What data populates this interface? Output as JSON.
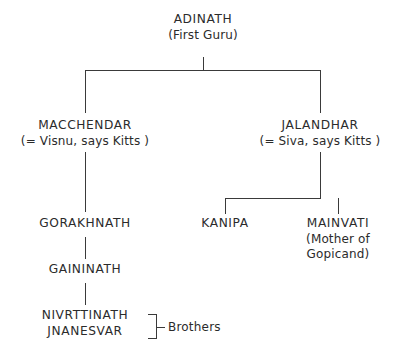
{
  "diagram": {
    "title_text": "ADINATH",
    "type": "genealogy-tree",
    "line_color": "#3a3a3a",
    "text_color": "#2b2b2b",
    "background_color": "#ffffff",
    "nodes": {
      "adinath": {
        "name": "ADINATH",
        "subtitle": "(First Guru)"
      },
      "macchendar": {
        "name": "MACCHENDAR",
        "subtitle": "(= Visnu, says Kitts )"
      },
      "jalandhar": {
        "name": "JALANDHAR",
        "subtitle": "(= Siva, says Kitts )"
      },
      "gorakhnath": {
        "name": "GORAKHNATH"
      },
      "gaininath": {
        "name": "GAININATH"
      },
      "nivrttinath": {
        "name": "NIVRTTINATH"
      },
      "jnanesvar": {
        "name": "JNANESVAR"
      },
      "kanipa": {
        "name": "KANIPA"
      },
      "mainvati": {
        "name": "MAINVATI",
        "subtitle_line1": "(Mother of",
        "subtitle_line2": "Gopicand)"
      }
    },
    "annotations": {
      "brothers_label": "Brothers"
    }
  }
}
